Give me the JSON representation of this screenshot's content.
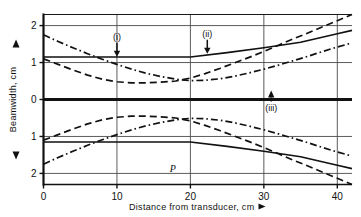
{
  "chart_data": {
    "type": "line",
    "title": "",
    "xlabel": "Distance from transducer, cm",
    "ylabel": "Beamwidth, cm",
    "xlim": [
      0,
      42
    ],
    "ylim": [
      -2.3,
      2.3
    ],
    "xticks": [
      0,
      10,
      20,
      30,
      40
    ],
    "xtick_labels": [
      "0",
      "10",
      "20",
      "30",
      "40"
    ],
    "yticks": [
      2,
      1,
      0,
      1,
      2
    ],
    "ytick_labels": [
      "2",
      "1",
      "0",
      "1",
      "2"
    ],
    "grid": true,
    "legend": "none",
    "symmetric_about_zero": true,
    "axis_arrow_up": "▲",
    "axis_arrow_down": "▼",
    "axis_arrow_right": "▶",
    "series": [
      {
        "name": "(i)",
        "style": "dashed",
        "note": "upper half shown; mirrored below axis",
        "x": [
          0,
          2,
          4,
          6,
          8,
          10,
          12,
          14,
          16,
          18,
          20,
          22,
          24,
          26,
          28,
          30,
          32,
          34,
          36,
          38,
          40,
          42
        ],
        "values": [
          1.1,
          0.95,
          0.8,
          0.66,
          0.55,
          0.48,
          0.45,
          0.45,
          0.47,
          0.5,
          0.58,
          0.7,
          0.84,
          0.99,
          1.14,
          1.3,
          1.47,
          1.64,
          1.8,
          1.97,
          2.13,
          2.3
        ]
      },
      {
        "name": "(ii)",
        "style": "solid",
        "note": "constant 1.15 up to 20 cm then rises linearly",
        "x": [
          0,
          10,
          20,
          25,
          30,
          35,
          40,
          42
        ],
        "values": [
          1.15,
          1.15,
          1.15,
          1.27,
          1.4,
          1.55,
          1.78,
          1.87
        ]
      },
      {
        "name": "(iii)",
        "style": "dash-dot",
        "x": [
          0,
          2,
          4,
          6,
          8,
          10,
          12,
          14,
          16,
          18,
          20,
          22,
          24,
          26,
          28,
          30,
          32,
          34,
          36,
          38,
          40,
          42
        ],
        "values": [
          1.75,
          1.57,
          1.4,
          1.24,
          1.09,
          0.95,
          0.82,
          0.71,
          0.62,
          0.55,
          0.51,
          0.52,
          0.56,
          0.63,
          0.72,
          0.82,
          0.93,
          1.05,
          1.17,
          1.3,
          1.42,
          1.53
        ]
      }
    ],
    "annotations": [
      {
        "text": "(i)",
        "x": 10.0,
        "y": 1.62,
        "arrow": "down"
      },
      {
        "text": "(ii)",
        "x": 22.3,
        "y": 1.7,
        "arrow": "down"
      },
      {
        "text": "(iii)",
        "x": 31.0,
        "y": 0.3,
        "arrow": "up"
      },
      {
        "text": "P",
        "x": 17.6,
        "y": -1.95,
        "arrow": "none"
      }
    ]
  }
}
